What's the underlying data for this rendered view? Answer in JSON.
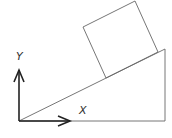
{
  "diagram": {
    "axes": {
      "x_label": "X",
      "y_label": "Y"
    },
    "colors": {
      "thin_line": "#666666",
      "axis": "#222222",
      "label": "#333333"
    },
    "shapes": {
      "incline": {
        "points": [
          [
            19,
            121
          ],
          [
            165,
            49
          ],
          [
            165,
            121
          ]
        ]
      },
      "block": {
        "points": [
          [
            83,
            27
          ],
          [
            135,
            1
          ],
          [
            158,
            52
          ],
          [
            106,
            78
          ]
        ]
      },
      "y_axis": {
        "from": [
          19,
          121
        ],
        "to": [
          19,
          70
        ]
      },
      "x_axis": {
        "from": [
          19,
          121
        ],
        "to": [
          70,
          121
        ]
      }
    }
  }
}
